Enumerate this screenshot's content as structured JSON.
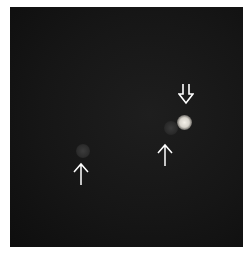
{
  "image": {
    "type": "fluorescence micrograph",
    "background_color": "#161616",
    "spots": [
      {
        "id": "bright-spot",
        "brightness": "high",
        "color": "#e8e4dc"
      },
      {
        "id": "dim-spot-right",
        "brightness": "low",
        "color": "#303030"
      },
      {
        "id": "dim-spot-left",
        "brightness": "low",
        "color": "#323232"
      }
    ],
    "arrows": [
      {
        "id": "hollow-down-arrow",
        "style": "hollow",
        "direction": "down",
        "target": "bright-spot",
        "color": "#ffffff"
      },
      {
        "id": "thin-up-arrow-right",
        "style": "line",
        "direction": "up",
        "target": "dim-spot-right",
        "color": "#ffffff"
      },
      {
        "id": "thin-up-arrow-left",
        "style": "line",
        "direction": "up",
        "target": "dim-spot-left",
        "color": "#ffffff"
      }
    ]
  }
}
